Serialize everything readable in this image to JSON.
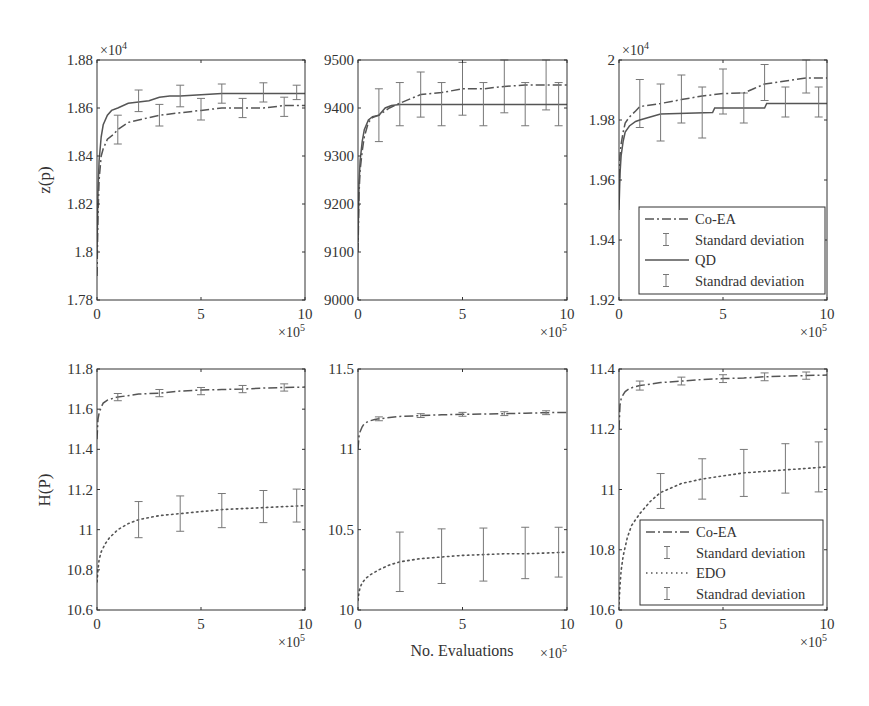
{
  "figure": {
    "ylabel_top": "z(p)",
    "ylabel_bottom": "H(P)",
    "xlabel": "No. Evaluations",
    "x_multiplier": "×10",
    "x_multiplier_exp": "5",
    "y_multiplier": "×10",
    "y_multiplier_exp": "4"
  },
  "colors": {
    "line": "#555555",
    "errorbar": "#777777",
    "axis": "#333333",
    "text": "#333333"
  },
  "legends": {
    "top": [
      {
        "style": "dashdot",
        "label": "Co-EA"
      },
      {
        "style": "errorbar",
        "label": "Standard deviation"
      },
      {
        "style": "solid",
        "label": "QD"
      },
      {
        "style": "errorbar",
        "label": "Standrad deviation"
      }
    ],
    "bottom": [
      {
        "style": "dashdot",
        "label": "Co-EA"
      },
      {
        "style": "errorbar",
        "label": "Standard deviation"
      },
      {
        "style": "dotted",
        "label": "EDO"
      },
      {
        "style": "errorbar",
        "label": "Standrad deviation"
      }
    ]
  },
  "chart_data": [
    {
      "id": "top-left",
      "type": "line",
      "title": "",
      "xlabel": "",
      "ylabel": "z(p)",
      "y_multiplier": "×10^4",
      "x_multiplier": "×10^5",
      "xlim": [
        0,
        10
      ],
      "ylim": [
        1.78,
        1.88
      ],
      "xticks": [
        0,
        5,
        10
      ],
      "yticks": [
        1.78,
        1.8,
        1.82,
        1.84,
        1.86,
        1.88
      ],
      "ytick_labels": [
        "1.78",
        "1.8",
        "1.82",
        "1.84",
        "1.86",
        "1.88"
      ],
      "box": {
        "x": 97,
        "y": 60,
        "w": 208,
        "h": 240
      },
      "series": [
        {
          "name": "Co-EA",
          "style": "dashdot",
          "x": [
            0,
            0.05,
            0.1,
            0.2,
            0.3,
            0.5,
            0.8,
            1,
            1.5,
            2,
            3,
            4,
            5,
            6,
            7,
            8,
            9,
            10
          ],
          "y": [
            1.79,
            1.815,
            1.83,
            1.84,
            1.843,
            1.847,
            1.849,
            1.851,
            1.854,
            1.855,
            1.857,
            1.858,
            1.859,
            1.86,
            1.86,
            1.86,
            1.861,
            1.861
          ],
          "errorbars": {
            "x": [
              1,
              3,
              5,
              7,
              9
            ],
            "y": [
              1.851,
              1.857,
              1.8595,
              1.86,
              1.8605
            ],
            "err": [
              0.006,
              0.0045,
              0.0045,
              0.004,
              0.004
            ]
          }
        },
        {
          "name": "QD",
          "style": "solid",
          "x": [
            0,
            0.05,
            0.1,
            0.2,
            0.3,
            0.5,
            0.7,
            1,
            1.5,
            2,
            2.5,
            3,
            3.5,
            4,
            5,
            6,
            7,
            8,
            9,
            10
          ],
          "y": [
            1.8,
            1.825,
            1.838,
            1.848,
            1.853,
            1.857,
            1.859,
            1.86,
            1.862,
            1.8625,
            1.863,
            1.8645,
            1.865,
            1.865,
            1.8655,
            1.866,
            1.866,
            1.866,
            1.866,
            1.866
          ],
          "errorbars": {
            "x": [
              2,
              4,
              6,
              8,
              9.6
            ],
            "y": [
              1.863,
              1.865,
              1.866,
              1.8665,
              1.8665
            ],
            "err": [
              0.0045,
              0.0045,
              0.004,
              0.004,
              0.003
            ]
          }
        }
      ]
    },
    {
      "id": "top-middle",
      "type": "line",
      "title": "",
      "xlabel": "",
      "ylabel": "",
      "x_multiplier": "×10^5",
      "xlim": [
        0,
        10
      ],
      "ylim": [
        9000,
        9500
      ],
      "xticks": [
        0,
        5,
        10
      ],
      "yticks": [
        9000,
        9100,
        9200,
        9300,
        9400,
        9500
      ],
      "ytick_labels": [
        "9000",
        "9100",
        "9200",
        "9300",
        "9400",
        "9500"
      ],
      "box": {
        "x": 358,
        "y": 60,
        "w": 209,
        "h": 240
      },
      "series": [
        {
          "name": "Co-EA",
          "style": "dashdot",
          "x": [
            0,
            0.05,
            0.1,
            0.2,
            0.3,
            0.5,
            0.7,
            1,
            1.5,
            2,
            3,
            4,
            5,
            6,
            7,
            8,
            9,
            10
          ],
          "y": [
            9100,
            9220,
            9270,
            9310,
            9340,
            9370,
            9380,
            9385,
            9400,
            9410,
            9428,
            9432,
            9440,
            9440,
            9445,
            9448,
            9448,
            9448
          ],
          "errorbars": {
            "x": [
              1,
              3,
              5,
              7,
              9
            ],
            "y": [
              9385,
              9428,
              9440,
              9445,
              9448
            ],
            "err": [
              55,
              47,
              55,
              55,
              52
            ]
          }
        },
        {
          "name": "QD",
          "style": "solid",
          "x": [
            0,
            0.05,
            0.1,
            0.2,
            0.3,
            0.5,
            0.7,
            1,
            1.3,
            1.6,
            2,
            3,
            4,
            5,
            6,
            7,
            8,
            9,
            10
          ],
          "y": [
            9120,
            9240,
            9290,
            9330,
            9355,
            9375,
            9382,
            9385,
            9400,
            9405,
            9407,
            9407,
            9407,
            9407,
            9407,
            9407,
            9407,
            9407,
            9407
          ],
          "errorbars": {
            "x": [
              2,
              4,
              6,
              8,
              9.6
            ],
            "y": [
              9408,
              9408,
              9408,
              9408,
              9408
            ],
            "err": [
              45,
              45,
              45,
              45,
              45
            ]
          }
        }
      ]
    },
    {
      "id": "top-right",
      "type": "line",
      "title": "",
      "xlabel": "",
      "ylabel": "",
      "y_multiplier": "×10^4",
      "x_multiplier": "×10^5",
      "xlim": [
        0,
        10
      ],
      "ylim": [
        1.92,
        2.0
      ],
      "xticks": [
        0,
        5,
        10
      ],
      "yticks": [
        1.92,
        1.94,
        1.96,
        1.98,
        2.0
      ],
      "ytick_labels": [
        "1.92",
        "1.94",
        "1.96",
        "1.98",
        "2"
      ],
      "box": {
        "x": 619,
        "y": 60,
        "w": 208,
        "h": 240
      },
      "legend": "top",
      "series": [
        {
          "name": "Co-EA",
          "style": "dashdot",
          "x": [
            0,
            0.05,
            0.1,
            0.2,
            0.3,
            0.5,
            0.8,
            1,
            2,
            3,
            4,
            5,
            6,
            6.5,
            7,
            8,
            9,
            10
          ],
          "y": [
            1.955,
            1.968,
            1.972,
            1.976,
            1.979,
            1.981,
            1.983,
            1.9845,
            1.9855,
            1.9868,
            1.988,
            1.9888,
            1.989,
            1.9905,
            1.992,
            1.993,
            1.994,
            1.994
          ],
          "errorbars": {
            "x": [
              1,
              3,
              5,
              7,
              9
            ],
            "y": [
              1.9855,
              1.987,
              1.9895,
              1.9925,
              1.9945
            ],
            "err": [
              0.008,
              0.008,
              0.0075,
              0.006,
              0.0055
            ]
          }
        },
        {
          "name": "QD",
          "style": "solid",
          "x": [
            0,
            0.05,
            0.1,
            0.2,
            0.3,
            0.5,
            0.8,
            1,
            1.5,
            2,
            4.5,
            4.6,
            7,
            7.1,
            10
          ],
          "y": [
            1.95,
            1.962,
            1.968,
            1.973,
            1.976,
            1.978,
            1.9795,
            1.98,
            1.981,
            1.982,
            1.9825,
            1.984,
            1.984,
            1.9855,
            1.9855
          ],
          "errorbars": {
            "x": [
              2,
              4,
              6,
              8,
              9.6
            ],
            "y": [
              1.9825,
              1.9825,
              1.984,
              1.986,
              1.986
            ],
            "err": [
              0.0095,
              0.0085,
              0.005,
              0.005,
              0.005
            ]
          }
        }
      ]
    },
    {
      "id": "bottom-left",
      "type": "line",
      "title": "",
      "xlabel": "",
      "ylabel": "H(P)",
      "x_multiplier": "×10^5",
      "xlim": [
        0,
        10
      ],
      "ylim": [
        10.6,
        11.8
      ],
      "xticks": [
        0,
        5,
        10
      ],
      "yticks": [
        10.6,
        10.8,
        11.0,
        11.2,
        11.4,
        11.6,
        11.8
      ],
      "ytick_labels": [
        "10.6",
        "10.8",
        "11",
        "11.2",
        "11.4",
        "11.6",
        "11.8"
      ],
      "box": {
        "x": 97,
        "y": 369,
        "w": 208,
        "h": 241
      },
      "series": [
        {
          "name": "Co-EA",
          "style": "dashdot",
          "x": [
            0,
            0.05,
            0.1,
            0.2,
            0.3,
            0.5,
            0.8,
            1,
            2,
            3,
            4,
            5,
            6,
            7,
            8,
            9,
            10
          ],
          "y": [
            11.45,
            11.55,
            11.58,
            11.61,
            11.63,
            11.645,
            11.655,
            11.66,
            11.675,
            11.68,
            11.69,
            11.695,
            11.698,
            11.7,
            11.705,
            11.708,
            11.71
          ],
          "errorbars": {
            "x": [
              1,
              3,
              5,
              7,
              9
            ],
            "y": [
              11.66,
              11.68,
              11.69,
              11.7,
              11.708
            ],
            "err": [
              0.018,
              0.018,
              0.018,
              0.018,
              0.018
            ]
          }
        },
        {
          "name": "EDO",
          "style": "dotted",
          "x": [
            0,
            0.05,
            0.1,
            0.2,
            0.4,
            0.6,
            1,
            1.5,
            2,
            3,
            4,
            5,
            6,
            7,
            8,
            9,
            10
          ],
          "y": [
            10.74,
            10.8,
            10.85,
            10.89,
            10.93,
            10.96,
            11.0,
            11.03,
            11.05,
            11.07,
            11.08,
            11.09,
            11.1,
            11.105,
            11.11,
            11.115,
            11.12
          ],
          "errorbars": {
            "x": [
              2,
              4,
              6,
              8,
              9.6
            ],
            "y": [
              11.05,
              11.08,
              11.095,
              11.115,
              11.12
            ],
            "err": [
              0.09,
              0.088,
              0.085,
              0.08,
              0.082
            ]
          }
        }
      ]
    },
    {
      "id": "bottom-middle",
      "type": "line",
      "title": "",
      "xlabel": "No. Evaluations",
      "ylabel": "",
      "x_multiplier": "×10^5",
      "xlim": [
        0,
        10
      ],
      "ylim": [
        10.0,
        11.5
      ],
      "xticks": [
        0,
        5,
        10
      ],
      "yticks": [
        10.0,
        10.5,
        11.0,
        11.5
      ],
      "ytick_labels": [
        "10",
        "10.5",
        "11",
        "11.5"
      ],
      "box": {
        "x": 358,
        "y": 369,
        "w": 209,
        "h": 241
      },
      "series": [
        {
          "name": "Co-EA",
          "style": "dashdot",
          "x": [
            0,
            0.05,
            0.1,
            0.2,
            0.3,
            0.5,
            0.8,
            1,
            2,
            3,
            4,
            5,
            6,
            7,
            8,
            9,
            10
          ],
          "y": [
            11.0,
            11.08,
            11.11,
            11.14,
            11.16,
            11.175,
            11.185,
            11.19,
            11.205,
            11.21,
            11.215,
            11.218,
            11.22,
            11.222,
            11.225,
            11.228,
            11.23
          ],
          "errorbars": {
            "x": [
              1,
              3,
              5,
              7,
              9
            ],
            "y": [
              11.19,
              11.21,
              11.218,
              11.222,
              11.228
            ],
            "err": [
              0.012,
              0.012,
              0.012,
              0.012,
              0.012
            ]
          }
        },
        {
          "name": "EDO",
          "style": "dotted",
          "x": [
            0,
            0.05,
            0.1,
            0.2,
            0.4,
            0.6,
            1,
            1.5,
            2,
            3,
            4,
            5,
            6,
            7,
            8,
            9,
            10
          ],
          "y": [
            10.06,
            10.11,
            10.14,
            10.17,
            10.2,
            10.22,
            10.25,
            10.28,
            10.3,
            10.32,
            10.33,
            10.34,
            10.345,
            10.35,
            10.35,
            10.355,
            10.36
          ],
          "errorbars": {
            "x": [
              2,
              4,
              6,
              8,
              9.6
            ],
            "y": [
              10.3,
              10.335,
              10.345,
              10.355,
              10.36
            ],
            "err": [
              0.185,
              0.17,
              0.165,
              0.16,
              0.155
            ]
          }
        }
      ]
    },
    {
      "id": "bottom-right",
      "type": "line",
      "title": "",
      "xlabel": "",
      "ylabel": "",
      "x_multiplier": "×10^5",
      "xlim": [
        0,
        10
      ],
      "ylim": [
        10.6,
        11.4
      ],
      "xticks": [
        0,
        5,
        10
      ],
      "yticks": [
        10.6,
        10.8,
        11.0,
        11.2,
        11.4
      ],
      "ytick_labels": [
        "10.6",
        "10.8",
        "11",
        "11.2",
        "11.4"
      ],
      "box": {
        "x": 619,
        "y": 369,
        "w": 208,
        "h": 241
      },
      "legend": "bottom",
      "series": [
        {
          "name": "Co-EA",
          "style": "dashdot",
          "x": [
            0,
            0.05,
            0.1,
            0.2,
            0.3,
            0.5,
            0.8,
            1,
            2,
            3,
            4,
            5,
            6,
            7,
            8,
            9,
            10
          ],
          "y": [
            11.2,
            11.28,
            11.3,
            11.315,
            11.325,
            11.335,
            11.342,
            11.345,
            11.355,
            11.36,
            11.365,
            11.368,
            11.37,
            11.374,
            11.376,
            11.378,
            11.38
          ],
          "errorbars": {
            "x": [
              1,
              3,
              5,
              7,
              9
            ],
            "y": [
              11.345,
              11.36,
              11.368,
              11.374,
              11.378
            ],
            "err": [
              0.015,
              0.013,
              0.013,
              0.013,
              0.012
            ]
          }
        },
        {
          "name": "EDO",
          "style": "dotted",
          "x": [
            0,
            0.05,
            0.1,
            0.2,
            0.4,
            0.6,
            1,
            1.5,
            2,
            3,
            4,
            5,
            6,
            7,
            8,
            9,
            10
          ],
          "y": [
            10.62,
            10.68,
            10.73,
            10.78,
            10.84,
            10.88,
            10.92,
            10.96,
            10.99,
            11.02,
            11.035,
            11.045,
            11.055,
            11.06,
            11.065,
            11.07,
            11.075
          ],
          "errorbars": {
            "x": [
              2,
              4,
              6,
              8,
              9.6
            ],
            "y": [
              10.995,
              11.035,
              11.055,
              11.07,
              11.075
            ],
            "err": [
              0.058,
              0.067,
              0.078,
              0.082,
              0.083
            ]
          }
        }
      ]
    }
  ]
}
